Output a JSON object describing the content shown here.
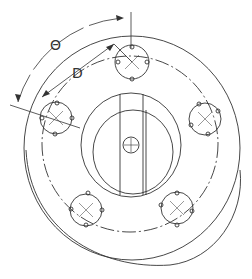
{
  "diagram": {
    "type": "technical-drawing",
    "labels": {
      "angle": "Θ",
      "distance": "D"
    },
    "bolt_hole_count": 5,
    "colors": {
      "line": "#333333",
      "background": "#ffffff"
    }
  }
}
